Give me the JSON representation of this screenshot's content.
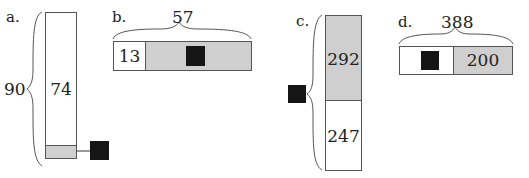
{
  "diagrams": [
    {
      "id": "a",
      "label": "a.",
      "orientation": "vertical",
      "total": "90",
      "parts": [
        {
          "value": "74",
          "shade": "white"
        },
        {
          "value": "unknown",
          "shade": "gray"
        }
      ],
      "unknown_marker": "black-square-with-arrow"
    },
    {
      "id": "b",
      "label": "b.",
      "orientation": "horizontal",
      "total": "57",
      "parts": [
        {
          "value": "13",
          "shade": "white"
        },
        {
          "value": "unknown",
          "shade": "gray"
        }
      ]
    },
    {
      "id": "c",
      "label": "c.",
      "orientation": "vertical",
      "total": "unknown",
      "parts": [
        {
          "value": "292",
          "shade": "gray"
        },
        {
          "value": "247",
          "shade": "white"
        }
      ]
    },
    {
      "id": "d",
      "label": "d.",
      "orientation": "horizontal",
      "total": "388",
      "parts": [
        {
          "value": "unknown",
          "shade": "white"
        },
        {
          "value": "200",
          "shade": "gray"
        }
      ]
    }
  ],
  "colors": {
    "gray_fill": "#cfcfcf",
    "unknown_fill": "#151515",
    "line": "#555555"
  }
}
